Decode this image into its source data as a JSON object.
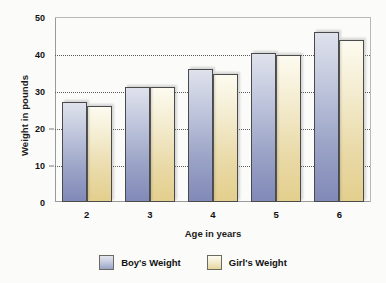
{
  "chart_data": {
    "type": "bar",
    "title": "",
    "xlabel": "Age in years",
    "ylabel": "Weight in pounds",
    "categories": [
      "2",
      "3",
      "4",
      "5",
      "6"
    ],
    "series": [
      {
        "name": "Boy's Weight",
        "color": "#9aa3c6",
        "values": [
          27,
          31,
          36,
          40.3,
          46
        ]
      },
      {
        "name": "Girl's Weight",
        "color": "#e6d69e",
        "values": [
          26,
          31,
          34.7,
          39.6,
          43.7
        ]
      }
    ],
    "ylim": [
      0,
      50
    ],
    "yticks": [
      "0",
      "10",
      "20",
      "30",
      "40",
      "50"
    ],
    "ytick_values": [
      0,
      10,
      20,
      30,
      40,
      50
    ],
    "grid": "horizontal-dotted",
    "legend_position": "bottom-center"
  },
  "legend": {
    "items": [
      {
        "label": "Boy's Weight"
      },
      {
        "label": "Girl's Weight"
      }
    ]
  }
}
